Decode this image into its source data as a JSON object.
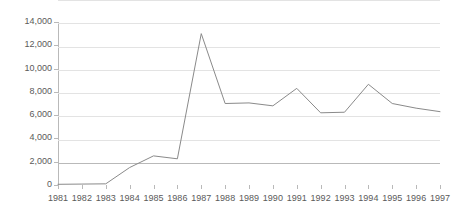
{
  "chart_data": {
    "type": "line",
    "title": "",
    "subtitle": "",
    "xlabel": "",
    "ylabel": "",
    "categories": [
      "1981",
      "1982",
      "1983",
      "1984",
      "1985",
      "1986",
      "1987",
      "1988",
      "1989",
      "1990",
      "1991",
      "1992",
      "1993",
      "1994",
      "1995",
      "1996",
      "1997"
    ],
    "series": [
      {
        "name": "",
        "values": [
          60,
          80,
          100,
          1500,
          2500,
          2250,
          13000,
          7000,
          7050,
          6800,
          8300,
          6200,
          6250,
          8650,
          7000,
          6600,
          6300
        ]
      }
    ],
    "ylim": [
      0,
      14000
    ],
    "ytick_values": [
      0,
      2000,
      4000,
      6000,
      8000,
      10000,
      12000,
      14000
    ],
    "ytick_labels": [
      "0",
      "2,000",
      "4,000",
      "6,000",
      "8,000",
      "10,000",
      "12,000",
      "14,000"
    ],
    "grid": "horizontal",
    "legend": "none",
    "annotations": [],
    "colors": {
      "line": "#8a8a8a",
      "gridline": "#e3e3e3",
      "axis": "#b9b9b9",
      "tick_text": "#5a5a5a",
      "background": "#ffffff"
    }
  }
}
